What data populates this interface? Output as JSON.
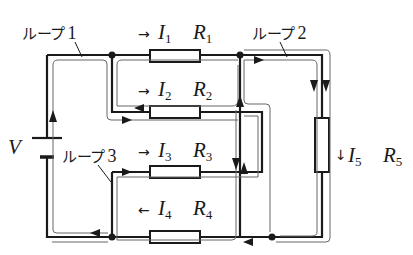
{
  "source": {
    "symbol": "V"
  },
  "resistors": [
    {
      "id": "R1",
      "label": "R",
      "sub": "1",
      "current_label": "I",
      "current_sub": "1",
      "current_direction": "right"
    },
    {
      "id": "R2",
      "label": "R",
      "sub": "2",
      "current_label": "I",
      "current_sub": "2",
      "current_direction": "right"
    },
    {
      "id": "R3",
      "label": "R",
      "sub": "3",
      "current_label": "I",
      "current_sub": "3",
      "current_direction": "right"
    },
    {
      "id": "R4",
      "label": "R",
      "sub": "4",
      "current_label": "I",
      "current_sub": "4",
      "current_direction": "left"
    },
    {
      "id": "R5",
      "label": "R",
      "sub": "5",
      "current_label": "I",
      "current_sub": "5",
      "current_direction": "down"
    }
  ],
  "loops": [
    {
      "text": "ループ",
      "number": "1"
    },
    {
      "text": "ループ",
      "number": "2"
    },
    {
      "text": "ループ",
      "number": "3"
    }
  ],
  "arrows": {
    "right": "→",
    "left": "←",
    "down": "↓"
  },
  "colors": {
    "wire": "#1a1a1a",
    "loop_path": "#555555",
    "background": "#ffffff"
  }
}
